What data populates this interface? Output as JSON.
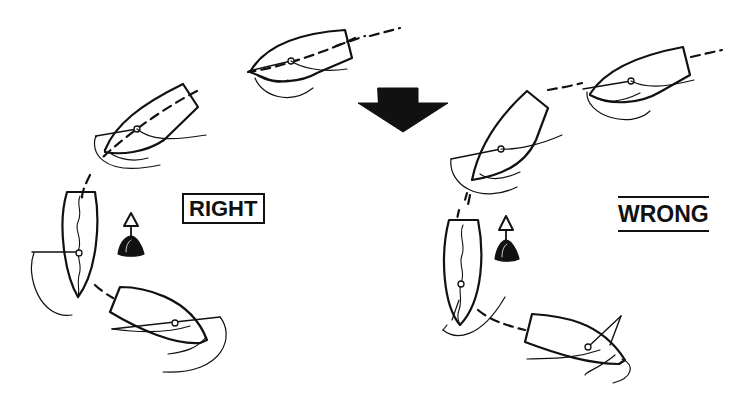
{
  "diagram": {
    "labels": {
      "right": "RIGHT",
      "wrong": "WRONG"
    },
    "icons": {
      "transition_arrow": "down-arrow",
      "mark": "buoy-icon"
    },
    "panels": [
      {
        "name": "right",
        "boats": 4,
        "mark": "buoy"
      },
      {
        "name": "wrong",
        "boats": 4,
        "mark": "buoy"
      }
    ],
    "colors": {
      "ink": "#111111",
      "background": "#ffffff"
    }
  }
}
